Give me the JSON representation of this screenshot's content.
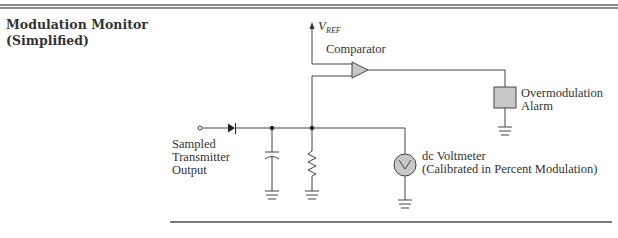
{
  "figure": {
    "title_line1": "Modulation Monitor",
    "title_line2": "(Simplified)"
  },
  "labels": {
    "vref_main": "V",
    "vref_sub": "REF",
    "comparator": "Comparator",
    "alarm_line1": "Overmodulation",
    "alarm_line2": "Alarm",
    "input_line1": "Sampled",
    "input_line2": "Transmitter",
    "input_line3": "Output",
    "voltmeter_line1": "dc Voltmeter",
    "voltmeter_line2": "(Calibrated in Percent Modulation)"
  },
  "components": [
    "input-terminal",
    "diode",
    "capacitor",
    "resistor",
    "comparator",
    "overmodulation-alarm",
    "dc-voltmeter",
    "ground"
  ],
  "colors": {
    "line": "#444444",
    "component_fill": "#c8c8c8",
    "rule": "#8a8a8a"
  }
}
